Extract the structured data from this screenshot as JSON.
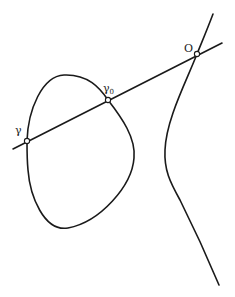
{
  "diagram": {
    "type": "elliptic-curve-secant",
    "colors": {
      "stroke": "#1a1a1a",
      "background": "#ffffff",
      "point_fill": "#ffffff"
    },
    "points": [
      {
        "id": "gamma",
        "label": "γ",
        "subscript": "",
        "x": 27,
        "y": 141
      },
      {
        "id": "gamma0",
        "label": "γ",
        "subscript": "0",
        "x": 108,
        "y": 100
      },
      {
        "id": "O",
        "label": "O",
        "subscript": "",
        "x": 197,
        "y": 54
      }
    ],
    "components": [
      "oval",
      "unbounded-branch",
      "secant-line"
    ]
  }
}
